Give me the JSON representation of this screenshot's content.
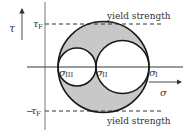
{
  "figure": {
    "type": "Mohr circle diagram",
    "axes": {
      "vertical_label": "τ",
      "horizontal_label": "σ"
    },
    "limits": {
      "upper_symbol": "τ",
      "upper_subscript": "F",
      "lower_prefix": "−",
      "lower_symbol": "τ",
      "lower_subscript": "F",
      "upper_caption": "yield strength",
      "lower_caption": "yield strength"
    },
    "principal_stresses": [
      {
        "symbol": "σ",
        "subscript": "III"
      },
      {
        "symbol": "σ",
        "subscript": "II"
      },
      {
        "symbol": "σ",
        "subscript": "I"
      }
    ],
    "colors": {
      "shaded_region": "#c8c8c8",
      "lines": "#1a1a1a",
      "axes": "#555555"
    }
  }
}
